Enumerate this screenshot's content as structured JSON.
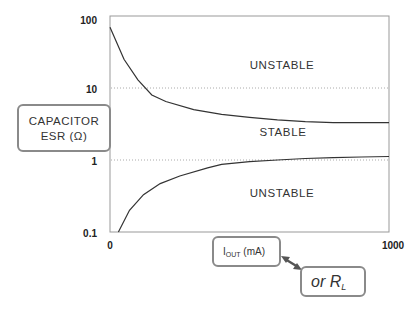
{
  "chart_data": {
    "type": "line",
    "title": "",
    "xlabel": "IOUT (mA) or RL",
    "ylabel": "CAPACITOR ESR (Ω)",
    "x_scale": "linear",
    "y_scale": "log",
    "xlim": [
      0,
      1000
    ],
    "ylim": [
      0.1,
      100
    ],
    "x_ticks": [
      "0",
      "1000"
    ],
    "y_ticks": [
      "100",
      "10",
      "1",
      "0.1"
    ],
    "grid": {
      "horizontal_dotted_at": [
        10,
        1
      ]
    },
    "series": [
      {
        "name": "Upper ESR boundary",
        "x": [
          0,
          50,
          100,
          150,
          200,
          300,
          400,
          500,
          600,
          700,
          800,
          900,
          1000
        ],
        "y": [
          70,
          25,
          13,
          8,
          6.5,
          5,
          4.3,
          3.9,
          3.6,
          3.4,
          3.3,
          3.3,
          3.3
        ]
      },
      {
        "name": "Lower ESR boundary",
        "x": [
          30,
          70,
          120,
          180,
          250,
          350,
          400,
          500,
          600,
          700,
          800,
          900,
          1000
        ],
        "y": [
          0.1,
          0.2,
          0.33,
          0.47,
          0.6,
          0.78,
          0.87,
          0.95,
          1.0,
          1.05,
          1.08,
          1.1,
          1.12
        ]
      }
    ],
    "annotations": [
      "UNSTABLE",
      "STABLE",
      "UNSTABLE"
    ]
  },
  "labels": {
    "y_axis_line1": "CAPACITOR",
    "y_axis_line2": "ESR  (Ω)",
    "x_axis_main": "I",
    "x_axis_sub": "OUT",
    "x_axis_unit": " (mA)",
    "alt_main": "or R",
    "alt_sub": "L"
  },
  "ticks": {
    "y100": "100",
    "y10": "10",
    "y1": "1",
    "y01": "0.1",
    "x0": "0",
    "x1000": "1000"
  },
  "regions": {
    "top": "UNSTABLE",
    "middle": "STABLE",
    "bottom": "UNSTABLE"
  }
}
